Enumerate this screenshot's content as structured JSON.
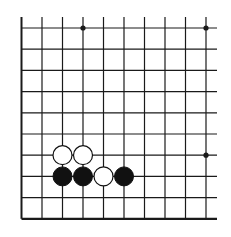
{
  "diagram": {
    "type": "go-board-fragment",
    "background": "#ffffff",
    "line_color": "#1a1a1a",
    "columns": 10,
    "rows": 10,
    "origin_x": 21.5,
    "origin_y": 28,
    "spacing_x": 20.5,
    "spacing_y": 21.2,
    "top_extension_y": 17,
    "right_extension_x": 217,
    "edges": {
      "left": true,
      "bottom": true,
      "top": false,
      "right": false
    },
    "star_points": [
      {
        "col": 3,
        "row": 0
      },
      {
        "col": 9,
        "row": 0
      },
      {
        "col": 9,
        "row": 6
      }
    ],
    "stones": [
      {
        "color": "white",
        "col": 2,
        "row": 6
      },
      {
        "color": "white",
        "col": 3,
        "row": 6
      },
      {
        "color": "black",
        "col": 2,
        "row": 7
      },
      {
        "color": "black",
        "col": 3,
        "row": 7
      },
      {
        "color": "white",
        "col": 4,
        "row": 7
      },
      {
        "color": "black",
        "col": 5,
        "row": 7
      }
    ],
    "stone_radius": 9.5
  }
}
